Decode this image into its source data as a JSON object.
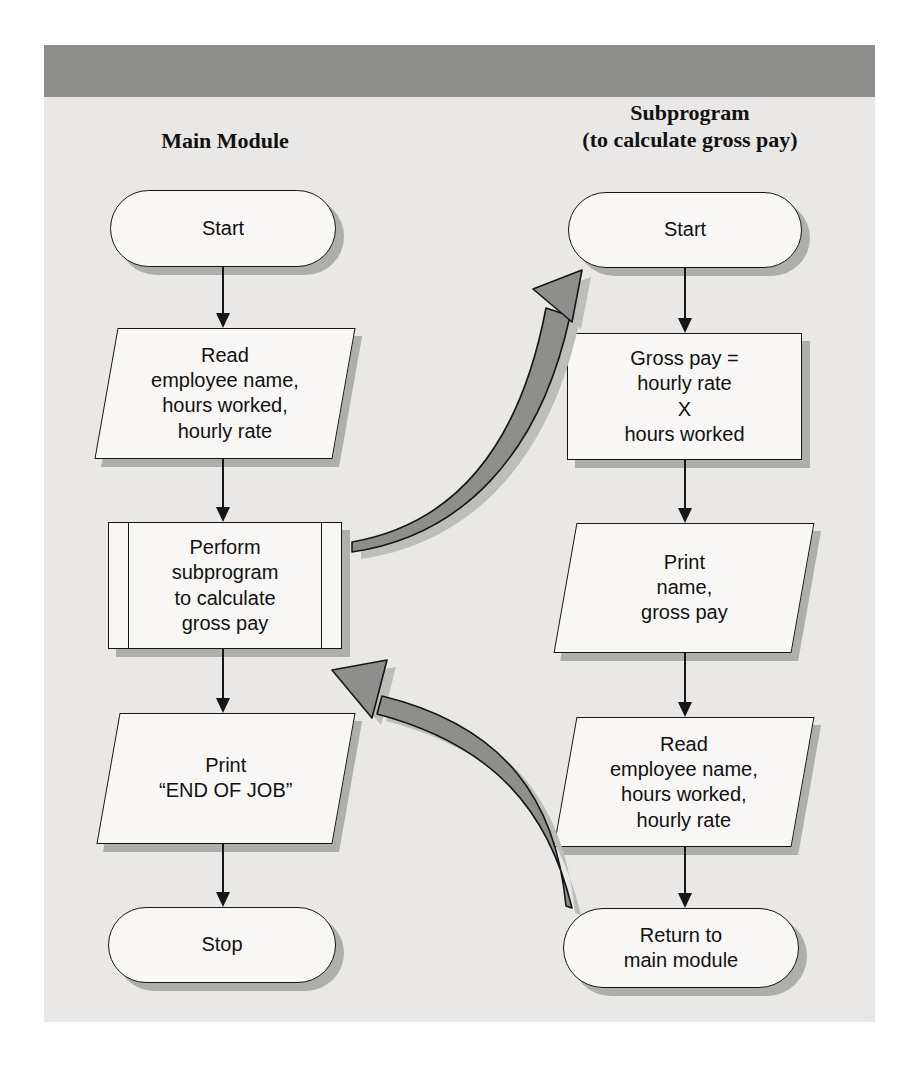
{
  "theme": {
    "panel_bg": "#e9e8e6",
    "header_bar": "#8d8d8b",
    "node_fill": "#f8f7f5",
    "node_border": "#161616",
    "shadow": "#aeaeac",
    "arrow_fill": "#8e8e8c",
    "arrow_shadow": "#bdbdbb",
    "text": "#111111"
  },
  "diagram": {
    "columns": [
      {
        "title": "Main Module",
        "nodes": [
          {
            "type": "terminator",
            "label": "Start"
          },
          {
            "type": "input-output",
            "label": "Read\nemployee name,\nhours worked,\nhourly rate"
          },
          {
            "type": "predefined-process",
            "label": "Perform\nsubprogram\nto calculate\ngross pay"
          },
          {
            "type": "input-output",
            "label": "Print\n“END OF JOB”"
          },
          {
            "type": "terminator",
            "label": "Stop"
          }
        ]
      },
      {
        "title": "Subprogram\n(to calculate gross pay)",
        "nodes": [
          {
            "type": "terminator",
            "label": "Start"
          },
          {
            "type": "process",
            "label": "Gross pay =\nhourly rate\nX\nhours worked"
          },
          {
            "type": "input-output",
            "label": "Print\nname,\ngross pay"
          },
          {
            "type": "input-output",
            "label": "Read\nemployee name,\nhours worked,\nhourly rate"
          },
          {
            "type": "terminator",
            "label": "Return to\nmain module"
          }
        ]
      }
    ],
    "connectors": {
      "call": {
        "from": "perform-subprogram",
        "to": "subprogram-start"
      },
      "return": {
        "from": "return-to-main-module",
        "to": "perform-subprogram"
      }
    }
  }
}
